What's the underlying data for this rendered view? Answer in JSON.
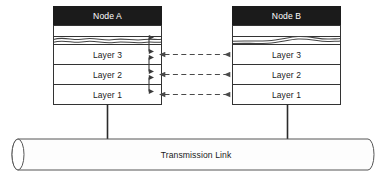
{
  "diagram": {
    "title_caption": "",
    "colors": {
      "header_fill": "#1b1b1b",
      "header_text": "#ffffff",
      "box_fill": "#ffffff",
      "stroke": "#333333",
      "arrow": "#3b3b3b",
      "dashed_arrow": "#4a4a4a",
      "link_fill": "#fdfdfd",
      "background": "#ffffff"
    },
    "nodes": [
      {
        "id": "node-a",
        "title": "Node A",
        "break_symbol": "wavy-break",
        "layers": [
          {
            "label": "Layer 3"
          },
          {
            "label": "Layer 2"
          },
          {
            "label": "Layer 1"
          }
        ]
      },
      {
        "id": "node-b",
        "title": "Node B",
        "break_symbol": "wavy-break",
        "layers": [
          {
            "label": "Layer 3"
          },
          {
            "label": "Layer 2"
          },
          {
            "label": "Layer 1"
          }
        ]
      }
    ],
    "vertical_arrows": {
      "count": 4,
      "style": "double-headed-solid",
      "description": "interlayer service access arrows inside Node A"
    },
    "peer_arrows": {
      "count": 3,
      "style": "double-headed-dashed",
      "labels": [
        "",
        "",
        ""
      ]
    },
    "transmission_link": {
      "label": "Transmission Link",
      "shape": "cylinder"
    },
    "connectors": {
      "count": 2,
      "style": "solid-vertical"
    }
  }
}
